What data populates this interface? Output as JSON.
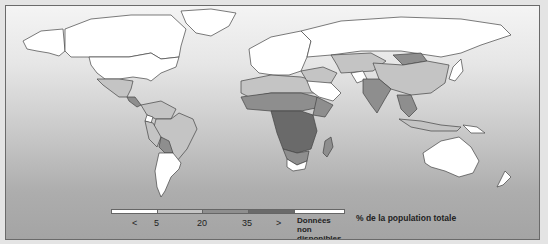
{
  "map": {
    "subject": "% de la population totale",
    "colors": {
      "lt5": "#ffffff",
      "5to20": "#c4c4c4",
      "20to35": "#8e8e8e",
      "gt35": "#6a6a6a",
      "no_data": "#ffffff",
      "ocean_top": "#f4f4f4",
      "ocean_bottom": "#a4a4a4",
      "border": "#444444"
    },
    "regions": [
      {
        "name": "Canada",
        "class": "no_data"
      },
      {
        "name": "United States",
        "class": "no_data"
      },
      {
        "name": "Greenland",
        "class": "no_data"
      },
      {
        "name": "Mexico",
        "class": "5to20"
      },
      {
        "name": "Central America",
        "class": "20to35"
      },
      {
        "name": "Ecuador",
        "class": "lt5"
      },
      {
        "name": "Brazil",
        "class": "5to20"
      },
      {
        "name": "Bolivia",
        "class": "20to35"
      },
      {
        "name": "Argentina",
        "class": "lt5"
      },
      {
        "name": "Uruguay",
        "class": "lt5"
      },
      {
        "name": "Europe",
        "class": "no_data"
      },
      {
        "name": "Russia",
        "class": "no_data"
      },
      {
        "name": "North Africa",
        "class": "5to20"
      },
      {
        "name": "Sahel",
        "class": "20to35"
      },
      {
        "name": "Central Africa",
        "class": "gt35"
      },
      {
        "name": "East Africa",
        "class": "gt35"
      },
      {
        "name": "South Africa",
        "class": "lt5"
      },
      {
        "name": "Madagascar",
        "class": "20to35"
      },
      {
        "name": "Arabian Peninsula",
        "class": "lt5"
      },
      {
        "name": "Afghanistan",
        "class": "lt5"
      },
      {
        "name": "Central Asia",
        "class": "5to20"
      },
      {
        "name": "Mongolia",
        "class": "20to35"
      },
      {
        "name": "China",
        "class": "5to20"
      },
      {
        "name": "India",
        "class": "20to35"
      },
      {
        "name": "Southeast Asia",
        "class": "20to35"
      },
      {
        "name": "Japan",
        "class": "no_data"
      },
      {
        "name": "Australia",
        "class": "no_data"
      },
      {
        "name": "New Zealand",
        "class": "no_data"
      }
    ]
  },
  "legend": {
    "title": "% de la population totale",
    "items": [
      {
        "label": "<",
        "color": "#ffffff"
      },
      {
        "label": "5",
        "color": "#c4c4c4"
      },
      {
        "label": "20",
        "color": "#8e8e8e"
      },
      {
        "label": "35",
        "color": "#6a6a6a"
      },
      {
        "label": ">",
        "color": "#ffffff"
      }
    ],
    "tick_labels": [
      "<",
      "5",
      "20",
      "35",
      ">"
    ],
    "no_data_line1": "Données",
    "no_data_line2": "non disponibles"
  }
}
